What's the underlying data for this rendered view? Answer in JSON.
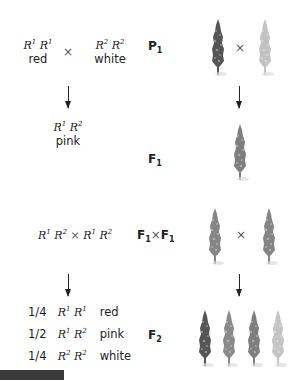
{
  "p1": {
    "parent1": {
      "allele_a": "R",
      "sup_a": "1",
      "allele_b": "R",
      "sup_b": "1",
      "phenotype": "red"
    },
    "times": "×",
    "parent2": {
      "allele_a": "R",
      "sup_a": "2",
      "allele_b": "R",
      "sup_b": "2",
      "phenotype": "white"
    },
    "label": "P",
    "label_sub": "1"
  },
  "f1": {
    "genotype": {
      "allele_a": "R",
      "sup_a": "1",
      "allele_b": "R",
      "sup_b": "2"
    },
    "phenotype": "pink",
    "label": "F",
    "label_sub": "1"
  },
  "f1_cross": {
    "left": {
      "allele_a": "R",
      "sup_a": "1",
      "allele_b": "R",
      "sup_b": "2"
    },
    "times": "×",
    "right": {
      "allele_a": "R",
      "sup_a": "1",
      "allele_b": "R",
      "sup_b": "2"
    },
    "label_left": "F",
    "label_left_sub": "1",
    "label_times": "×",
    "label_right": "F",
    "label_right_sub": "1"
  },
  "f2": {
    "label": "F",
    "label_sub": "2",
    "rows": [
      {
        "fraction": "1/4",
        "allele_a": "R",
        "sup_a": "1",
        "allele_b": "R",
        "sup_b": "1",
        "phenotype": "red"
      },
      {
        "fraction": "1/2",
        "allele_a": "R",
        "sup_a": "1",
        "allele_b": "R",
        "sup_b": "2",
        "phenotype": "pink"
      },
      {
        "fraction": "1/4",
        "allele_a": "R",
        "sup_a": "2",
        "allele_b": "R",
        "sup_b": "2",
        "phenotype": "white"
      }
    ]
  },
  "plants": {
    "times": "×",
    "colors": {
      "red": "#5a5a5a",
      "pink": "#8a8a8a",
      "white": "#c4c4c4"
    }
  }
}
